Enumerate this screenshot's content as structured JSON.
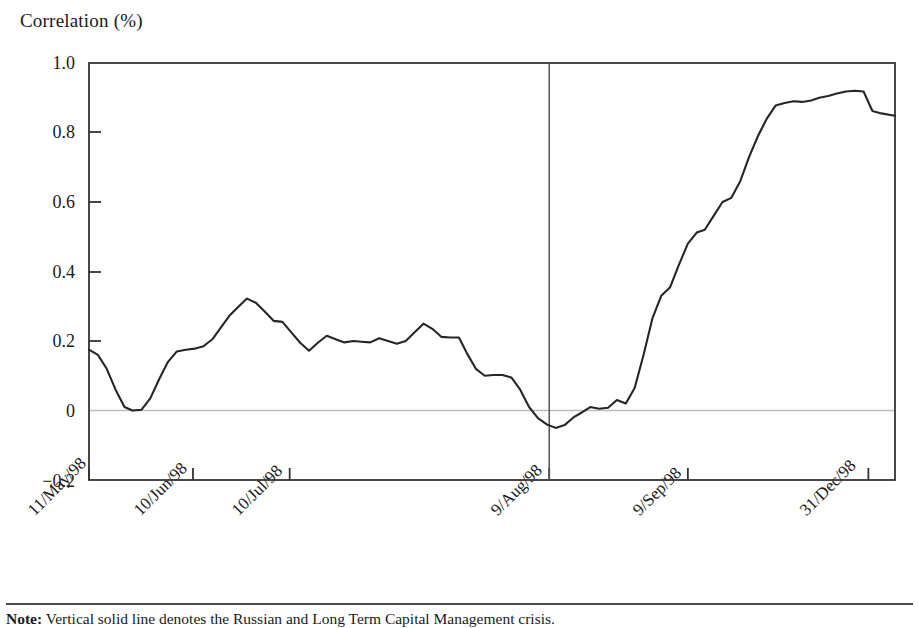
{
  "figure": {
    "axis_title": "Correlation (%)",
    "note_prefix": "Note:",
    "note_text": " Vertical solid line denotes the Russian and Long Term Capital Management crisis."
  },
  "chart_data": {
    "type": "line",
    "title": "Correlation (%)",
    "xlabel": "",
    "ylabel": "Correlation (%)",
    "ylim": [
      -0.2,
      1.0
    ],
    "yticks": [
      1.0,
      0.8,
      0.6,
      0.4,
      0.2,
      0.0,
      -0.2
    ],
    "ytick_labels": [
      "1.0",
      "0.8",
      "0.6",
      "0.4",
      "0.2",
      "0",
      "−0.2"
    ],
    "xtick_labels": [
      "11/May/98",
      "10/Jun/98",
      "10/Jul/98",
      "9/Aug/98",
      "9/Sep/98",
      "31/Dec/98"
    ],
    "xtick_positions": [
      0.0,
      0.129,
      0.249,
      0.571,
      0.743,
      0.967
    ],
    "grid": false,
    "zero_line": true,
    "legend": null,
    "annotations": [
      {
        "name": "crisis-marker",
        "type": "vline",
        "x": 0.571,
        "label": "9/Aug/98"
      }
    ],
    "series": [
      {
        "name": "Correlation",
        "color": "#262626",
        "x": [
          0.0,
          0.011,
          0.022,
          0.033,
          0.044,
          0.054,
          0.065,
          0.076,
          0.087,
          0.098,
          0.109,
          0.12,
          0.131,
          0.142,
          0.153,
          0.164,
          0.175,
          0.186,
          0.196,
          0.207,
          0.218,
          0.229,
          0.24,
          0.251,
          0.262,
          0.273,
          0.284,
          0.295,
          0.306,
          0.317,
          0.328,
          0.338,
          0.349,
          0.36,
          0.371,
          0.382,
          0.393,
          0.404,
          0.415,
          0.426,
          0.437,
          0.448,
          0.459,
          0.47,
          0.48,
          0.491,
          0.502,
          0.513,
          0.524,
          0.535,
          0.546,
          0.557,
          0.568,
          0.579,
          0.59,
          0.601,
          0.612,
          0.622,
          0.633,
          0.644,
          0.655,
          0.666,
          0.677,
          0.688,
          0.699,
          0.71,
          0.721,
          0.732,
          0.743,
          0.754,
          0.764,
          0.775,
          0.786,
          0.797,
          0.808,
          0.819,
          0.83,
          0.841,
          0.852,
          0.863,
          0.874,
          0.885,
          0.896,
          0.906,
          0.917,
          0.928,
          0.939,
          0.95,
          0.961,
          0.972,
          0.983,
          1.0
        ],
        "y": [
          0.175,
          0.16,
          0.12,
          0.06,
          0.01,
          0.0,
          0.002,
          0.035,
          0.09,
          0.14,
          0.17,
          0.175,
          0.178,
          0.185,
          0.205,
          0.24,
          0.275,
          0.3,
          0.322,
          0.31,
          0.285,
          0.258,
          0.255,
          0.225,
          0.195,
          0.172,
          0.195,
          0.215,
          0.205,
          0.196,
          0.2,
          0.198,
          0.196,
          0.208,
          0.2,
          0.192,
          0.2,
          0.225,
          0.25,
          0.235,
          0.212,
          0.21,
          0.21,
          0.16,
          0.12,
          0.1,
          0.102,
          0.102,
          0.095,
          0.06,
          0.01,
          -0.022,
          -0.04,
          -0.05,
          -0.042,
          -0.02,
          -0.005,
          0.01,
          0.005,
          0.008,
          0.03,
          0.02,
          0.065,
          0.16,
          0.265,
          0.33,
          0.355,
          0.42,
          0.48,
          0.512,
          0.52,
          0.56,
          0.6,
          0.612,
          0.66,
          0.73,
          0.79,
          0.84,
          0.878,
          0.885,
          0.89,
          0.888,
          0.892,
          0.9,
          0.905,
          0.912,
          0.918,
          0.92,
          0.918,
          0.862,
          0.855,
          0.848
        ],
        "note_y_range": [
          -0.05,
          0.92
        ]
      }
    ]
  }
}
